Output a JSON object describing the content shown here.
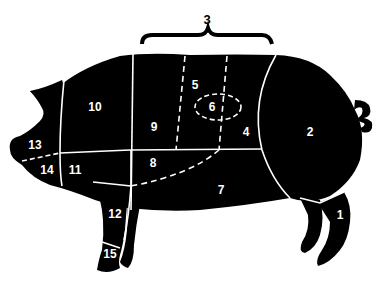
{
  "diagram": {
    "colors": {
      "silhouette": "#000000",
      "cut_lines": "#ffffff",
      "background": "#ffffff",
      "labels": "#ffffff"
    },
    "group_label": {
      "text": "3",
      "spans": [
        "5",
        "6",
        "4"
      ]
    },
    "cuts": [
      {
        "id": "1",
        "label": "1",
        "x": 340,
        "y": 219
      },
      {
        "id": "2",
        "label": "2",
        "x": 310,
        "y": 136
      },
      {
        "id": "4",
        "label": "4",
        "x": 246,
        "y": 136
      },
      {
        "id": "5",
        "label": "5",
        "x": 195,
        "y": 89
      },
      {
        "id": "6",
        "label": "6",
        "x": 212,
        "y": 111
      },
      {
        "id": "7",
        "label": "7",
        "x": 221,
        "y": 194
      },
      {
        "id": "8",
        "label": "8",
        "x": 153,
        "y": 167
      },
      {
        "id": "9",
        "label": "9",
        "x": 154,
        "y": 131
      },
      {
        "id": "10",
        "label": "10",
        "x": 95,
        "y": 111
      },
      {
        "id": "11",
        "label": "11",
        "x": 75,
        "y": 174
      },
      {
        "id": "12",
        "label": "12",
        "x": 115,
        "y": 218
      },
      {
        "id": "13",
        "label": "13",
        "x": 35,
        "y": 149
      },
      {
        "id": "14",
        "label": "14",
        "x": 47,
        "y": 174
      },
      {
        "id": "15",
        "label": "15",
        "x": 110,
        "y": 258
      }
    ]
  }
}
